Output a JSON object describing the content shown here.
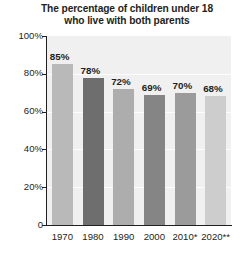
{
  "chart_data": {
    "type": "bar",
    "title": "The percentage of children under 18 who live with both parents",
    "title_lines": [
      "The percentage of children under 18",
      "who live with both parents"
    ],
    "categories": [
      "1970",
      "1980",
      "1990",
      "2000",
      "2010*",
      "2020**"
    ],
    "values": [
      85,
      78,
      72,
      69,
      70,
      68
    ],
    "value_labels": [
      "85%",
      "78%",
      "72%",
      "69%",
      "70%",
      "68%"
    ],
    "bar_colors": [
      "#b9b9b9",
      "#6e6e6e",
      "#adadad",
      "#858585",
      "#9b9b9b",
      "#cdcdcd"
    ],
    "xlabel": "",
    "ylabel": "",
    "ylim": [
      0,
      100
    ],
    "yticks": [
      0,
      20,
      40,
      60,
      80,
      100
    ],
    "ytick_labels": [
      "0",
      "20%",
      "40%",
      "60%",
      "80%",
      "100%"
    ],
    "grid": true,
    "grid_color": "#ffffff",
    "legend": null,
    "plot_background": "#f0f0f0",
    "page_background": "#ffffff",
    "axis_color": "#231f20",
    "text_color": "#231f20"
  }
}
